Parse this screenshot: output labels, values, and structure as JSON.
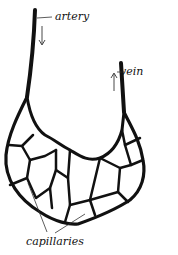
{
  "diagram": {
    "labels": {
      "artery": "artery",
      "vein": "vein",
      "capillaries": "capillaries"
    },
    "arrows": {
      "artery_flow": "down",
      "vein_flow": "up"
    },
    "colors": {
      "ink": "#111111",
      "background": "#ffffff",
      "leader": "#555555"
    }
  }
}
